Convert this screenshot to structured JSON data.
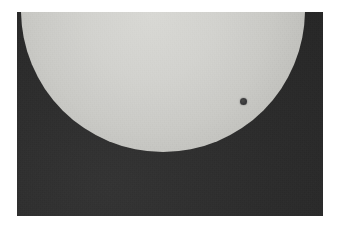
{
  "photo": {
    "subject": "planetary-transit-across-solar-disk",
    "caption": "",
    "frame": {
      "x": 17,
      "y": 12,
      "width": 306,
      "height": 204,
      "background_color": "#2f2f2f",
      "page_background_color": "#ffffff"
    }
  },
  "chart_data": {
    "type": "scatter",
    "title": "",
    "subtitle": "",
    "xlabel": "",
    "ylabel": "",
    "grid": false,
    "legend_position": "none",
    "objects": [
      {
        "name": "solar-disk",
        "shape": "circle",
        "center_x": 163,
        "center_y": 10,
        "radius": 142,
        "fill_color": "#d2d2ce",
        "limb_color": "#a3a39f",
        "cropped_at_top": true,
        "leftmost_x": 52,
        "rightmost_x": 272,
        "bottommost_y": 151
      },
      {
        "name": "transit-planet",
        "shape": "circle",
        "center_x": 243,
        "center_y": 101,
        "radius": 3.5,
        "diameter": 7,
        "fill_color": "#38383a"
      }
    ],
    "background": {
      "name": "sky",
      "fill_color": "#2e2e2e"
    },
    "colors": {
      "sun_bright": "#d8d8d4",
      "sun_limb": "#a3a39f",
      "planet": "#38383a",
      "sky": "#2e2e2e",
      "page": "#ffffff"
    }
  }
}
